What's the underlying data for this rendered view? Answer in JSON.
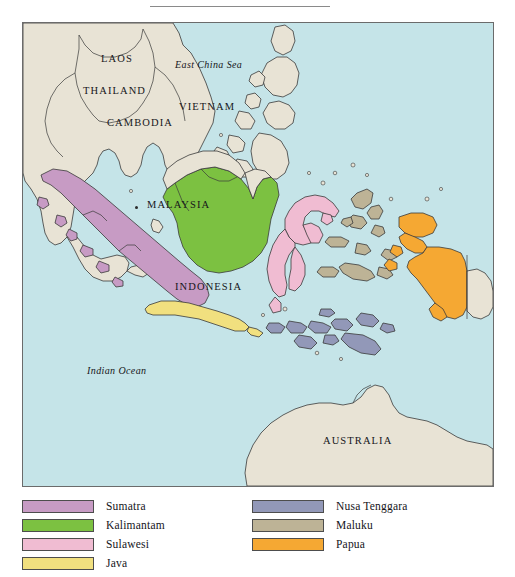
{
  "figure": {
    "kind": "reference-map",
    "has_top_rule": true
  },
  "map": {
    "ocean_color": "#c5e4e8",
    "land_color": "#e8e3d5",
    "coastline_color": "#3a3a3a",
    "border_color": "#6b6b6b",
    "country_labels": [
      {
        "name": "LAOS",
        "x": 78,
        "y": 30
      },
      {
        "name": "THAILAND",
        "x": 60,
        "y": 62
      },
      {
        "name": "VIETNAM",
        "x": 156,
        "y": 78
      },
      {
        "name": "CAMBODIA",
        "x": 84,
        "y": 94
      },
      {
        "name": "MALAYSIA",
        "x": 137,
        "y": 180
      },
      {
        "name": "INDONESIA",
        "x": 165,
        "y": 262
      },
      {
        "name": "AUSTRALIA",
        "x": 321,
        "y": 418
      }
    ],
    "sea_labels": [
      {
        "name": "East China Sea",
        "x": 173,
        "y": 42
      },
      {
        "name": "Indian Ocean",
        "x": 87,
        "y": 348
      }
    ]
  },
  "legend": {
    "column_one": [
      {
        "label": "Sumatra",
        "color": "#c79bc4"
      },
      {
        "label": "Kalimantam",
        "color": "#7cc141"
      },
      {
        "label": "Sulawesi",
        "color": "#f0bcd2"
      },
      {
        "label": "Java",
        "color": "#f1e07f"
      }
    ],
    "column_two": [
      {
        "label": "Nusa Tenggara",
        "color": "#9298b8"
      },
      {
        "label": "Maluku",
        "color": "#bdb396"
      },
      {
        "label": "Papua",
        "color": "#f5a833"
      }
    ]
  }
}
